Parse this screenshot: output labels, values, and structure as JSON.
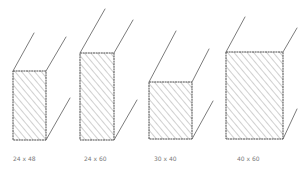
{
  "diagram": {
    "title": "",
    "stroke_color": "#5a5a5a",
    "hatch_color": "#8a8a8a",
    "label_color": "#7a7a7a",
    "boxes": [
      {
        "label": "24 x 48"
      },
      {
        "label": "24 x 60"
      },
      {
        "label": "30 x 40"
      },
      {
        "label": "40 x 60"
      }
    ]
  }
}
